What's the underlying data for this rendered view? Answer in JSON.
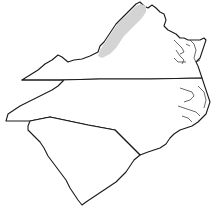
{
  "map": {
    "type": "outline-map",
    "states": [
      {
        "name": "Virginia",
        "label_visible": false
      },
      {
        "name": "North Carolina",
        "label_visible": false
      },
      {
        "name": "South Carolina",
        "label_visible": false
      }
    ],
    "highlighted_region": {
      "description": "shaded valley region in western Virginia",
      "color": "#d4d4d4"
    },
    "colors": {
      "background": "#ffffff",
      "outline": "#1a1a1a",
      "shade": "#d4d4d4"
    }
  }
}
